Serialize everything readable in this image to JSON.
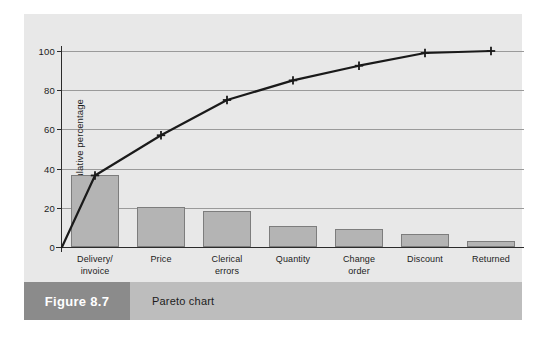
{
  "figure": {
    "number_label": "Figure 8.7",
    "caption": "Pareto chart"
  },
  "colors": {
    "panel_background": "#e8e8e8",
    "bar_fill": "#b4b4b4",
    "bar_stroke": "#7d7d7d",
    "line_color": "#1a1a1a",
    "gridline": "#9a9a9a",
    "caption_band": "#bdbdbd",
    "figure_number_box": "#8b8b8b"
  },
  "chart_data": {
    "type": "bar",
    "title": "",
    "subtitle": "",
    "xlabel": "",
    "ylabel": "Cumulative percentage",
    "categories": [
      "Delivery/\ninvoice",
      "Price",
      "Clerical\nerrors",
      "Quantity",
      "Change\norder",
      "Discount",
      "Returned"
    ],
    "category_lines": [
      [
        "Delivery/",
        "invoice"
      ],
      [
        "Price"
      ],
      [
        "Clerical",
        "errors"
      ],
      [
        "Quantity"
      ],
      [
        "Change",
        "order"
      ],
      [
        "Discount"
      ],
      [
        "Returned"
      ]
    ],
    "values": [
      36.5,
      20.5,
      18.5,
      10.5,
      9.0,
      6.5,
      3.0
    ],
    "series": [
      {
        "name": "Frequency percentage",
        "type": "bar",
        "values": [
          36.5,
          20.5,
          18.5,
          10.5,
          9.0,
          6.5,
          3.0
        ]
      },
      {
        "name": "Cumulative percentage",
        "type": "line",
        "values": [
          36.5,
          57.0,
          75.0,
          85.0,
          92.5,
          99.0,
          100.0
        ],
        "starts_at_origin": true,
        "origin_value": 0,
        "marker": "plus"
      }
    ],
    "ylim": [
      0,
      100
    ],
    "yticks": [
      0,
      20,
      40,
      60,
      80,
      100
    ],
    "ytick_labels": [
      "0",
      "20",
      "40",
      "60",
      "80",
      "100"
    ],
    "grid": true,
    "grid_axis": "y",
    "legend": false,
    "legend_position": "none"
  }
}
